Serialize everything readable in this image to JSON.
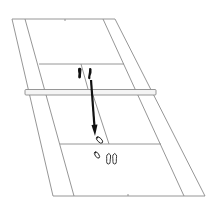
{
  "diagram": {
    "description": "Perspective view of a court with net; footprints show a step from near the net back toward the rear service area, indicated by an arrow",
    "colors": {
      "background": "#ffffff",
      "court_lines": "#8a8a8a",
      "net_fill": "#f4f4f4",
      "net_stroke": "#8a8a8a",
      "arrow": "#111111",
      "footprint_solid": "#111111",
      "footprint_outline": "#222222"
    },
    "elements": {
      "court": "court-outline",
      "net": "net-bar",
      "start_footprints": "start-position-feet",
      "arrow": "movement-arrow",
      "end_footprints": "end-position-feet"
    }
  }
}
